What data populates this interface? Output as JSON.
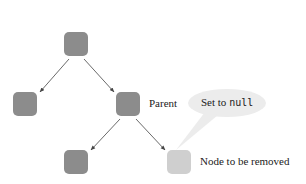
{
  "diagram": {
    "nodes": [
      {
        "id": "root",
        "shade": "dark"
      },
      {
        "id": "left-child",
        "shade": "dark"
      },
      {
        "id": "parent",
        "shade": "dark"
      },
      {
        "id": "parent-left-child",
        "shade": "dark"
      },
      {
        "id": "node-to-remove",
        "shade": "light"
      }
    ],
    "labels": {
      "parent": "Parent",
      "removed": "Node to be removed"
    },
    "callout": {
      "prefix": "Set to ",
      "code": "null"
    },
    "colors": {
      "node_dark": "#8c8c8c",
      "node_light": "#cfcfcf",
      "callout_fill": "#ececec",
      "edge": "#444444"
    }
  }
}
